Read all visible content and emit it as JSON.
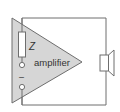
{
  "diagram": {
    "labels": {
      "impedance": "Z",
      "amplifier": "amplifier",
      "minus": "–"
    },
    "components": [
      {
        "type": "amplifier-triangle",
        "label": "amplifier"
      },
      {
        "type": "impedance-resistor",
        "label": "Z"
      },
      {
        "type": "input-terminal",
        "label": ""
      },
      {
        "type": "input-terminal",
        "label": "–"
      },
      {
        "type": "loudspeaker",
        "label": ""
      }
    ],
    "colors": {
      "triangle_fill": "#d6d6d6",
      "triangle_stroke": "#6e6e6e",
      "wire": "#6e6e6e",
      "resistor_fill": "#ffffff",
      "speaker_fill": "#ffffff",
      "background": "#ffffff"
    }
  }
}
